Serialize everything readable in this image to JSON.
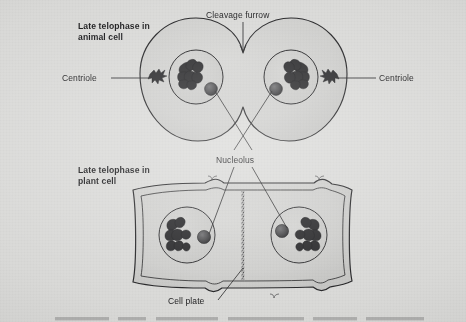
{
  "figure": {
    "background_color": "#d9d9d7",
    "ink_color": "#1b1b1d",
    "cell_fill": "#cfcfcd",
    "caption": {
      "number": "Figure 10.9",
      "text": "Telophase. During telophase, the spindle disintegrates and the nuclear",
      "cropped": true
    }
  },
  "panels": [
    {
      "id": "animal",
      "title_line1": "Late telophase in",
      "title_line2": "animal cell",
      "structures": [
        "cleavage-furrow",
        "centriole",
        "nucleolus",
        "nucleus",
        "chromatin"
      ]
    },
    {
      "id": "plant",
      "title_line1": "Late telophase in",
      "title_line2": "plant cell",
      "structures": [
        "cell-plate",
        "cell-wall",
        "nucleolus",
        "nucleus",
        "chromatin"
      ]
    }
  ],
  "labels": {
    "animal_title_1": "Late telophase in",
    "animal_title_2": "animal cell",
    "plant_title_1": "Late telophase in",
    "plant_title_2": "plant cell",
    "cleavage_furrow": "Cleavage furrow",
    "centriole_left": "Centriole",
    "centriole_right": "Centriole",
    "nucleolus": "Nucleolus",
    "cell_plate": "Cell plate"
  }
}
